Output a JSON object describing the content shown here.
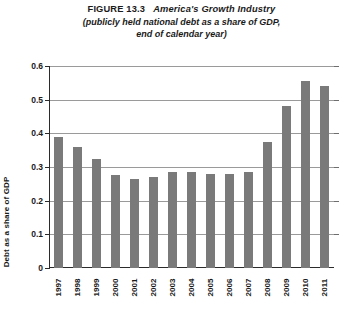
{
  "title": {
    "figure_number": "FIGURE 13.3",
    "figure_name": "America's Growth Industry",
    "subtitle_line1": "(publicly held national debt as a share of GDP,",
    "subtitle_line2": "end of calendar year)"
  },
  "colors": {
    "bar": "#7a7a7a",
    "axis": "#2b2b2b",
    "grid": "#9a9a9a",
    "background": "#ffffff"
  },
  "chart_data": {
    "type": "bar",
    "subtitle": "(publicly held national debt as a share of GDP, end of calendar year)",
    "xlabel": "",
    "ylabel": "Debt as a share of GDP",
    "categories": [
      "1997",
      "1998",
      "1999",
      "2000",
      "2001",
      "2002",
      "2003",
      "2004",
      "2005",
      "2006",
      "2007",
      "2008",
      "2009",
      "2010",
      "2011"
    ],
    "values": [
      0.39,
      0.36,
      0.325,
      0.275,
      0.265,
      0.27,
      0.285,
      0.285,
      0.28,
      0.28,
      0.285,
      0.375,
      0.48,
      0.555,
      0.54
    ],
    "ylim": [
      0,
      0.6
    ],
    "ytick_labels": [
      "0",
      "0.1",
      "0.2",
      "0.3",
      "0.4",
      "0.5",
      "0.6"
    ],
    "ytick_values": [
      0,
      0.1,
      0.2,
      0.3,
      0.4,
      0.5,
      0.6
    ],
    "grid": true,
    "legend": false,
    "bar_color": "#7a7a7a"
  }
}
